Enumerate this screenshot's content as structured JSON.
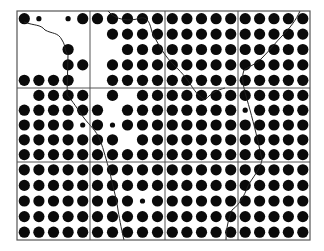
{
  "figure": {
    "frame": {
      "x": 17,
      "y": 11,
      "width": 293,
      "height": 229
    },
    "grid": {
      "cols": 4,
      "rows": 3,
      "col_lines": [
        90,
        165,
        238
      ],
      "row_lines": [
        88,
        162
      ]
    },
    "colors": {
      "dot": "#0a0a0a",
      "line": "#555555",
      "boundary": "#222222",
      "background": "#ffffff"
    },
    "dots_per_panel": 5,
    "panels": [
      {
        "r": 0,
        "c": 0,
        "cells": [
          "BS0S B",
          "00000",
          "000B0",
          "000BB",
          "BBBB0"
        ]
      },
      {
        "r": 0,
        "c": 1,
        "cells": [
          "BBBBB",
          "0BBBB",
          "00BBB",
          "0BBBB",
          "0BBBB"
        ]
      },
      {
        "r": 0,
        "c": 2,
        "cells": [
          "BBBBB",
          "BBBBB",
          "BBBBB",
          "BBBBB",
          "BBBBB"
        ]
      },
      {
        "r": 0,
        "c": 3,
        "cells": [
          "BBBBB",
          "BBBBB",
          "BBBBB",
          "BBBBB",
          "BBBBB"
        ]
      },
      {
        "r": 1,
        "c": 0,
        "cells": [
          "0BBBB",
          "BBBBB",
          "BBBBS",
          "BBBBB",
          "BBBBB"
        ]
      },
      {
        "r": 1,
        "c": 1,
        "cells": [
          "0B0BB",
          "B0BBB",
          "BSBBB",
          "BB0BB",
          "BBBBB"
        ]
      },
      {
        "r": 1,
        "c": 2,
        "cells": [
          "BBBBB",
          "BBBBB",
          "BBBBB",
          "BBBBB",
          "BBBBB"
        ]
      },
      {
        "r": 1,
        "c": 3,
        "cells": [
          "BBBBB",
          "SBBBB",
          "BBBBB",
          "BBBBB",
          "BBBBB"
        ]
      },
      {
        "r": 2,
        "c": 0,
        "cells": [
          "BBBBB",
          "BBBBB",
          "BBBBB",
          "BBBBB",
          "BBBBB"
        ]
      },
      {
        "r": 2,
        "c": 1,
        "cells": [
          "BBBBB",
          "BBBBB",
          "BBBSB",
          "BBBBB",
          "BBBBB"
        ]
      },
      {
        "r": 2,
        "c": 2,
        "cells": [
          "BBBBB",
          "BBBBB",
          "BBBBB",
          "BBBBB",
          "BBBBB"
        ]
      },
      {
        "r": 2,
        "c": 3,
        "cells": [
          "BBBBB",
          "BBBBB",
          "BBBBB",
          "BBBBB",
          "BBBBB"
        ]
      }
    ],
    "boundaries": [
      "M24,22 C35,26 40,24 45,30 C52,34 58,32 62,40 C66,46 64,50 68,55 L67,95 C72,100 78,110 84,118 C90,126 96,130 100,140 C104,150 106,160 110,172 C112,185 116,195 118,210 C120,222 122,232 124,240",
      "M108,11 C115,20 130,22 140,18 C148,16 150,24 152,32 C156,40 160,48 166,56 C172,64 178,68 186,78 C192,86 196,95 205,100 C212,92 218,90 225,88",
      "M300,11 C296,20 290,28 282,36 C276,42 270,50 262,58 C256,64 250,66 244,70 C240,80 246,95 250,110 C254,125 258,140 262,160 C260,170 252,178 248,186 C244,196 240,204 232,210 C228,220 226,230 226,240"
    ]
  }
}
